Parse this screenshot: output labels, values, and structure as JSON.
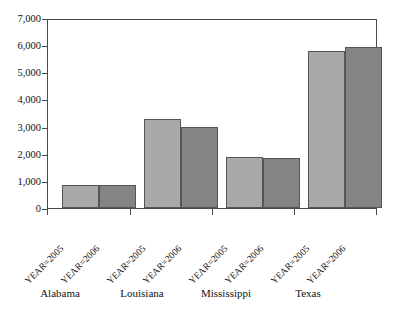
{
  "chart_data": {
    "type": "bar",
    "title": "",
    "xlabel": "",
    "ylabel": "",
    "ylim": [
      0,
      7000
    ],
    "grid": false,
    "legend_position": "none",
    "categories": [
      "Alabama",
      "Louisiana",
      "Mississippi",
      "Texas"
    ],
    "subcategories": [
      "YEAR=2005",
      "YEAR=2006"
    ],
    "series": [
      {
        "name": "YEAR=2005",
        "color": "#a9a9a9",
        "values": [
          870,
          3330,
          1900,
          5860
        ]
      },
      {
        "name": "YEAR=2006",
        "color": "#848484",
        "values": [
          870,
          3000,
          1870,
          6010
        ]
      }
    ],
    "ytick_labels": [
      "7,000",
      "6,000",
      "5,000",
      "4,000",
      "3,000",
      "2,000",
      "1,000",
      "0"
    ],
    "ytick_values": [
      7000,
      6000,
      5000,
      4000,
      3000,
      2000,
      1000,
      0
    ],
    "xtick_labels": [
      "YEAR=2005",
      "YEAR=2006",
      "YEAR=2005",
      "YEAR=2006",
      "YEAR=2005",
      "YEAR=2006",
      "YEAR=2005",
      "YEAR=2006"
    ]
  },
  "axis": {
    "y_label_0": "0",
    "y_label_1000": "1,000",
    "y_label_2000": "2,000",
    "y_label_3000": "3,000",
    "y_label_4000": "4,000",
    "y_label_5000": "5,000",
    "y_label_6000": "6,000",
    "y_label_7000": "7,000"
  },
  "groups": {
    "g0": {
      "label": "Alabama",
      "y2005": "YEAR=2005",
      "y2006": "YEAR=2006"
    },
    "g1": {
      "label": "Louisiana",
      "y2005": "YEAR=2005",
      "y2006": "YEAR=2006"
    },
    "g2": {
      "label": "Mississippi",
      "y2005": "YEAR=2005",
      "y2006": "YEAR=2006"
    },
    "g3": {
      "label": "Texas",
      "y2005": "YEAR=2005",
      "y2006": "YEAR=2006"
    }
  },
  "colors": {
    "bar_2005": "#a9a9a9",
    "bar_2006": "#848484",
    "axis": "#4a4a4a",
    "background": "#ffffff"
  }
}
